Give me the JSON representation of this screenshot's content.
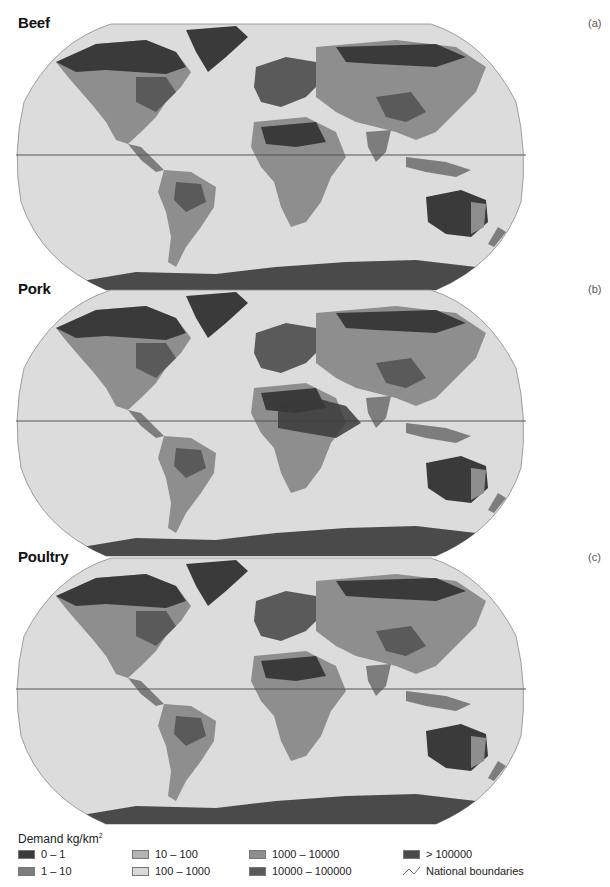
{
  "figure": {
    "panels": [
      {
        "title": "Beef",
        "tag": "(a)"
      },
      {
        "title": "Pork",
        "tag": "(b)"
      },
      {
        "title": "Poultry",
        "tag": "(c)"
      }
    ],
    "projection": "Robinson",
    "ocean_color": "#dcdcdc",
    "equator_color": "#555555"
  },
  "legend": {
    "title": "Demand kg/km",
    "title_superscript": "2",
    "classes": [
      {
        "label": "0 – 1",
        "color": "#3a3a3a"
      },
      {
        "label": "1 – 10",
        "color": "#7d7d7d"
      },
      {
        "label": "10 – 100",
        "color": "#b4b4b4"
      },
      {
        "label": "100 – 1000",
        "color": "#d9d9d9"
      },
      {
        "label": "1000 – 10000",
        "color": "#8e8e8e"
      },
      {
        "label": "10000 – 100000",
        "color": "#5a5a5a"
      },
      {
        "label": "> 100000",
        "color": "#4a4a4a"
      }
    ],
    "boundaries_label": "National boundaries",
    "boundaries_icon": "polyline-icon"
  }
}
